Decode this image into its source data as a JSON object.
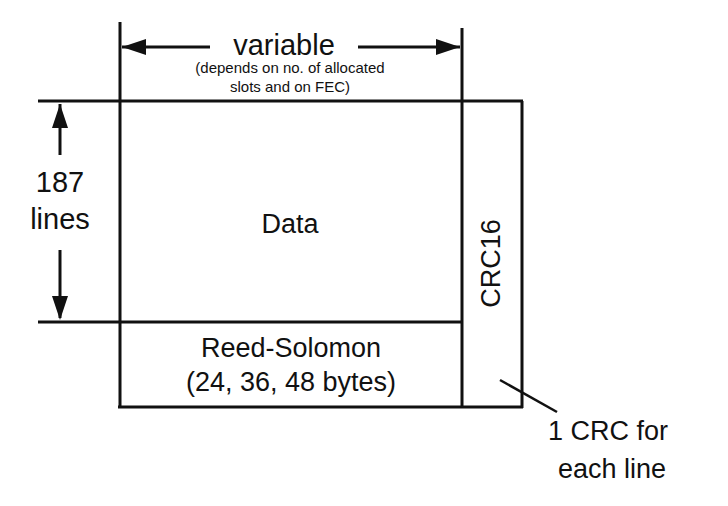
{
  "diagram": {
    "width_label": {
      "title": "variable",
      "note_line1": "(depends on no. of allocated",
      "note_line2": "slots and on FEC)"
    },
    "height_label": {
      "line1": "187",
      "line2": "lines"
    },
    "data_block": {
      "label": "Data"
    },
    "rs_block": {
      "line1": "Reed-Solomon",
      "line2": "(24, 36, 48 bytes)"
    },
    "crc_block": {
      "label": "CRC16"
    },
    "crc_note": {
      "line1": "1 CRC for",
      "line2": "each line"
    },
    "colors": {
      "stroke": "#111111",
      "background": "#ffffff"
    }
  }
}
